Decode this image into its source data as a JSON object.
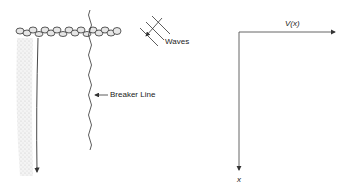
{
  "left_panel": {
    "waves_label": "Waves",
    "breaker_label": "Breaker Line"
  },
  "right_panel": {
    "x_axis_label": "V(x)",
    "y_axis_label": "x"
  },
  "colors": {
    "line": "#333333",
    "beach_shading": "#dcdcdc",
    "rock_fill": "#e6e6e6"
  }
}
